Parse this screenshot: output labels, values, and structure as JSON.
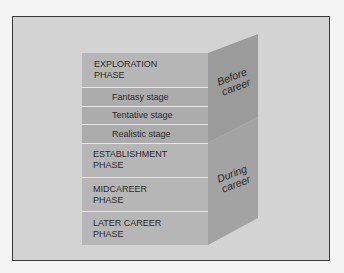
{
  "figure": {
    "front_rows": [
      {
        "type": "phase",
        "line1": "EXPLORATION",
        "line2": "PHASE"
      },
      {
        "type": "stage",
        "line1": "Fantasy stage"
      },
      {
        "type": "stage",
        "line1": "Tentative stage"
      },
      {
        "type": "stage",
        "line1": "Realistic stage"
      },
      {
        "type": "phase",
        "line1": "ESTABLISHMENT",
        "line2": "PHASE"
      },
      {
        "type": "phase",
        "line1": "MIDCAREER",
        "line2": "PHASE"
      },
      {
        "type": "phase",
        "line1": "LATER CAREER",
        "line2": "PHASE"
      }
    ],
    "side_labels": {
      "before": {
        "line1": "Before",
        "line2": "career"
      },
      "during": {
        "line1": "During",
        "line2": "career"
      }
    },
    "colors": {
      "background": "#f4f4f4",
      "frame_fill": "#d3d3d3",
      "frame_border": "#3a3a3a",
      "phase_row": "#b6b6b6",
      "stage_row": "#acacac",
      "divider": "#e6e6e6",
      "side_top": "#9a9a9a",
      "side_bottom": "#a2a2a2"
    }
  }
}
